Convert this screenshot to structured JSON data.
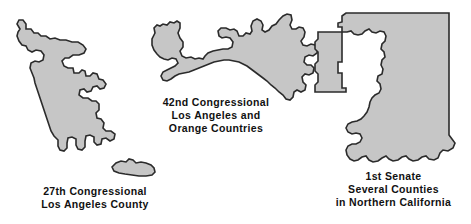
{
  "figure": {
    "background_color": "#ffffff",
    "shape_fill_color": "#c6c6c6",
    "shape_outline_color": "#2b2b2b",
    "text_color": "#111111"
  },
  "districts": [
    {
      "id": "27th-congressional",
      "caption_lines": [
        "27th Congressional",
        "Los Angeles County"
      ],
      "shape_count": 2
    },
    {
      "id": "42nd-congressional",
      "caption_lines": [
        "42nd Congressional",
        "Los Angeles and",
        "Orange Countries"
      ],
      "shape_count": 1
    },
    {
      "id": "1st-senate",
      "caption_lines": [
        "1st Senate",
        "Several Counties",
        "in Northern California"
      ],
      "shape_count": 1
    }
  ]
}
